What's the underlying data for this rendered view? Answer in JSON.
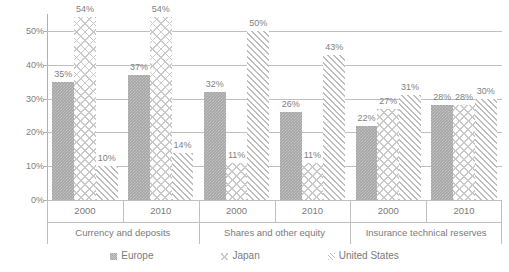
{
  "chart_data": {
    "type": "bar",
    "title": "",
    "subtitle": "",
    "xlabel": "",
    "ylabel": "",
    "ylim": [
      0,
      55
    ],
    "yticks": [
      "0%",
      "10%",
      "20%",
      "30%",
      "40%",
      "50%"
    ],
    "ytick_values": [
      0,
      10,
      20,
      30,
      40,
      50
    ],
    "grid": "horizontal",
    "legend_position": "bottom",
    "value_suffix": "%",
    "groups": [
      {
        "name": "Currency and deposits",
        "years": [
          {
            "year": "2000",
            "points": [
              {
                "series": "Europe",
                "value": 35,
                "label": "35%"
              },
              {
                "series": "Japan",
                "value": 54,
                "label": "54%"
              },
              {
                "series": "United States",
                "value": 10,
                "label": "10%"
              }
            ]
          },
          {
            "year": "2010",
            "points": [
              {
                "series": "Europe",
                "value": 37,
                "label": "37%"
              },
              {
                "series": "Japan",
                "value": 54,
                "label": "54%"
              },
              {
                "series": "United States",
                "value": 14,
                "label": "14%"
              }
            ]
          }
        ]
      },
      {
        "name": "Shares and other equity",
        "years": [
          {
            "year": "2000",
            "points": [
              {
                "series": "Europe",
                "value": 32,
                "label": "32%"
              },
              {
                "series": "Japan",
                "value": 11,
                "label": "11%"
              },
              {
                "series": "United States",
                "value": 50,
                "label": "50%"
              }
            ]
          },
          {
            "year": "2010",
            "points": [
              {
                "series": "Europe",
                "value": 26,
                "label": "26%"
              },
              {
                "series": "Japan",
                "value": 11,
                "label": "11%"
              },
              {
                "series": "United States",
                "value": 43,
                "label": "43%"
              }
            ]
          }
        ]
      },
      {
        "name": "Insurance technical reserves",
        "years": [
          {
            "year": "2000",
            "points": [
              {
                "series": "Europe",
                "value": 22,
                "label": "22%"
              },
              {
                "series": "Japan",
                "value": 27,
                "label": "27%"
              },
              {
                "series": "United States",
                "value": 31,
                "label": "31%"
              }
            ]
          },
          {
            "year": "2010",
            "points": [
              {
                "series": "Europe",
                "value": 28,
                "label": "28%"
              },
              {
                "series": "Japan",
                "value": 28,
                "label": "28%"
              },
              {
                "series": "United States",
                "value": 30,
                "label": "30%"
              }
            ]
          }
        ]
      }
    ],
    "series": [
      {
        "name": "Europe",
        "key": "europe",
        "pattern": "solid-gray-checker",
        "color": "#a6a6a6",
        "values": [
          35,
          37,
          32,
          26,
          22,
          28
        ]
      },
      {
        "name": "Japan",
        "key": "japan",
        "pattern": "cross-hatch",
        "color": "#c9c9c9",
        "values": [
          54,
          54,
          11,
          11,
          27,
          28
        ]
      },
      {
        "name": "United States",
        "key": "us",
        "pattern": "diagonal-hatch",
        "color": "#bdbdbd",
        "values": [
          10,
          14,
          50,
          43,
          31,
          30
        ]
      }
    ],
    "categories": [
      "Currency and deposits 2000",
      "Currency and deposits 2010",
      "Shares and other equity 2000",
      "Shares and other equity 2010",
      "Insurance technical reserves 2000",
      "Insurance technical reserves 2010"
    ],
    "legend": [
      {
        "label": "Europe",
        "key": "europe"
      },
      {
        "label": "Japan",
        "key": "japan"
      },
      {
        "label": "United States",
        "key": "us"
      }
    ]
  }
}
